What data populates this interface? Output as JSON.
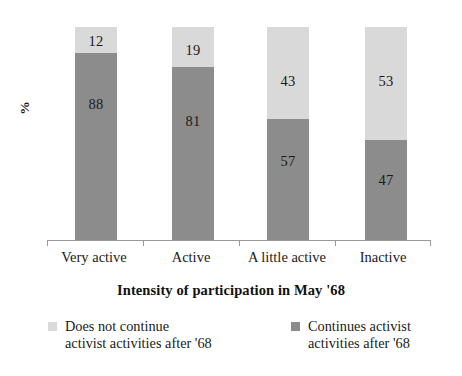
{
  "chart_data": {
    "type": "bar",
    "subtype": "stacked-100-percent",
    "title": "",
    "xlabel": "Intensity of participation in May '68",
    "ylabel": "%",
    "ylim": [
      0,
      100
    ],
    "grid": false,
    "legend_position": "bottom",
    "categories": [
      "Very active",
      "Active",
      "A little active",
      "Inactive"
    ],
    "series": [
      {
        "name": "Does not continue\nactivist activities after '68",
        "color": "#d9d9d9",
        "values": [
          12,
          19,
          43,
          53
        ]
      },
      {
        "name": "Continues activist\nactivities after '68",
        "color": "#8c8c8c",
        "values": [
          88,
          81,
          57,
          47
        ]
      }
    ]
  },
  "axis": {
    "y_title": "%",
    "x_title": "Intensity of participation in May '68"
  },
  "bars": [
    {
      "category": "Very active",
      "top_value": "12",
      "bottom_value": "88",
      "top_pct": 12,
      "bottom_pct": 88,
      "left_px": 28,
      "tick_px": 47
    },
    {
      "category": "Active",
      "top_value": "19",
      "bottom_value": "81",
      "top_pct": 19,
      "bottom_pct": 81,
      "left_px": 125,
      "tick_px": 143
    },
    {
      "category": "A little active",
      "top_value": "43",
      "bottom_value": "57",
      "top_pct": 43,
      "bottom_pct": 57,
      "left_px": 220,
      "tick_px": 239
    },
    {
      "category": "Inactive",
      "top_value": "53",
      "bottom_value": "47",
      "top_pct": 53,
      "bottom_pct": 47,
      "left_px": 318,
      "tick_px": 335
    }
  ],
  "category_labels": [
    {
      "text": "Very active",
      "left": 46,
      "width": 96
    },
    {
      "text": "Active",
      "left": 143,
      "width": 96
    },
    {
      "text": "A little active",
      "left": 237,
      "width": 100
    },
    {
      "text": "Inactive",
      "left": 335,
      "width": 96
    }
  ],
  "ticks": [
    47,
    143,
    239,
    335,
    430
  ],
  "legend": {
    "items": [
      {
        "label": "Does not continue\nactivist activities after '68",
        "color": "#d9d9d9",
        "swatch_name": "legend-swatch-light"
      },
      {
        "label": "Continues activist\nactivities after '68",
        "color": "#8c8c8c",
        "swatch_name": "legend-swatch-dark"
      }
    ]
  },
  "colors": {
    "light_gray": "#d9d9d9",
    "dark_gray": "#8c8c8c",
    "axis": "#9a9a9a",
    "text": "#1a1a1a",
    "background": "#ffffff"
  }
}
